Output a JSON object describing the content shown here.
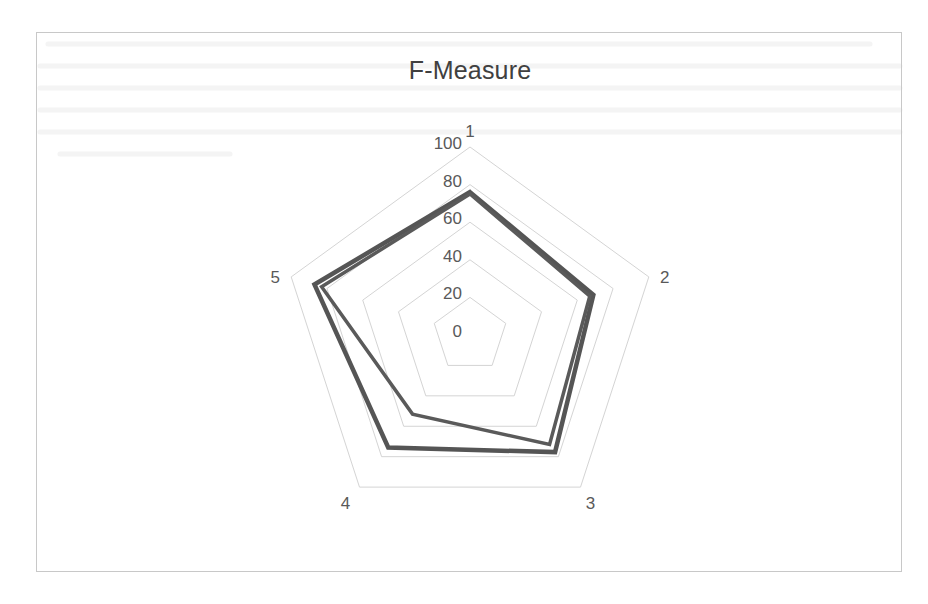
{
  "chart_data": {
    "type": "radar",
    "title": "F-Measure",
    "categories": [
      "1",
      "2",
      "3",
      "4",
      "5"
    ],
    "series": [
      {
        "name": "Series 1",
        "values": [
          76,
          69,
          77,
          74,
          87
        ],
        "color": "#555555",
        "stroke_width": 4.5
      },
      {
        "name": "Series 2",
        "values": [
          75,
          67,
          72,
          52,
          83
        ],
        "color": "#5a5a5a",
        "stroke_width": 3.5
      }
    ],
    "radial_axis": {
      "min": 0,
      "max": 100,
      "ticks": [
        0,
        20,
        40,
        60,
        80,
        100
      ],
      "tick_labels": [
        "0",
        "20",
        "40",
        "60",
        "80",
        "100"
      ]
    },
    "grid": true,
    "legend": "none",
    "xlabel": "",
    "ylabel": ""
  },
  "colors": {
    "grid": "#d4d4d4",
    "frame": "#c8c8c8",
    "text": "#595959",
    "title": "#404040"
  }
}
